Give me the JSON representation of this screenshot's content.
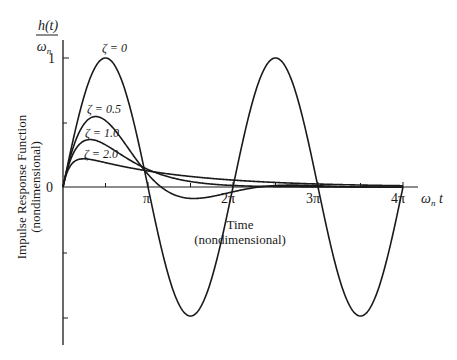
{
  "chart_data": {
    "type": "line",
    "title": "",
    "ylabel_top": {
      "numerator": "h(t)",
      "denominator": "ω_n"
    },
    "ylabel": [
      "Impulse Response Function",
      "(nondimensional)"
    ],
    "xlabel": [
      "Time",
      "(nondimensional)"
    ],
    "xaxis_symbol": "ω_n t",
    "x_ticks": [
      {
        "value": 3.14159,
        "label": "π"
      },
      {
        "value": 6.28319,
        "label": "2π"
      },
      {
        "value": 9.42478,
        "label": "3π"
      },
      {
        "value": 12.56637,
        "label": "4π"
      }
    ],
    "y_ticks": [
      {
        "value": 1,
        "label": "1"
      },
      {
        "value": 0.5,
        "label": ""
      },
      {
        "value": 0,
        "label": "0"
      },
      {
        "value": -0.5,
        "label": ""
      },
      {
        "value": -1,
        "label": ""
      }
    ],
    "xlim": [
      0,
      12.57
    ],
    "ylim": [
      -1.2,
      1.2
    ],
    "grid": false,
    "legend": "inline annotations",
    "series": [
      {
        "name": "ζ = 0",
        "zeta": 0,
        "description": "undamped: sin(ω_n t)",
        "peak": 1.0
      },
      {
        "name": "ζ = 0.5",
        "zeta": 0.5,
        "description": "underdamped",
        "peak": 0.54
      },
      {
        "name": "ζ = 1.0",
        "zeta": 1.0,
        "description": "critically damped: ω_n t·e^(-ω_n t)",
        "peak": 0.37
      },
      {
        "name": "ζ = 2.0",
        "zeta": 2.0,
        "description": "overdamped",
        "peak": 0.22
      }
    ]
  },
  "labels": {
    "zeta0": "ζ = 0",
    "zeta05": "ζ = 0.5",
    "zeta1": "ζ = 1.0",
    "zeta2": "ζ = 2.0",
    "num": "h(t)",
    "den": "ω",
    "den_sub": "n",
    "one": "1",
    "zero": "0",
    "pi1": "π",
    "pi2": "2π",
    "pi3": "3π",
    "pi4": "4π",
    "xsym": "ω",
    "xsym_sub": "n",
    "xsym_t": " t",
    "time": "Time",
    "time_sub": "(nondimensional)",
    "yl1": "Impulse Response Function",
    "yl2": "(nondimensional)"
  }
}
